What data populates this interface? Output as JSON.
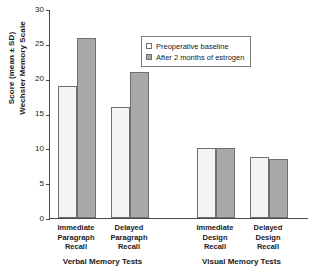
{
  "chart_data": {
    "type": "bar",
    "title": "",
    "xlabel": "",
    "ylabel": "Score (mean ± SD) Wechsler Memory Scale",
    "ylabel_lines": [
      "Score (mean ± SD)",
      "Wechsler Memory Scale"
    ],
    "ylim": [
      0,
      30
    ],
    "yticks": [
      0,
      5,
      10,
      15,
      20,
      25,
      30
    ],
    "ytick_labels": [
      "0",
      "5",
      "10",
      "15",
      "20",
      "25",
      "30"
    ],
    "grid": false,
    "legend_position": "upper right inside",
    "categories": [
      "Immediate Paragraph Recall",
      "Delayed Paragraph Recall",
      "Immediate Design Recall",
      "Delayed Design Recall"
    ],
    "category_lines": [
      [
        "Immediate",
        "Paragraph",
        "Recall"
      ],
      [
        "Delayed",
        "Paragraph",
        "Recall"
      ],
      [
        "Immediate",
        "Design",
        "Recall"
      ],
      [
        "Delayed",
        "Design",
        "Recall"
      ]
    ],
    "series": [
      {
        "name": "Preoperative baseline",
        "color": "#f4f4f4",
        "values": [
          19.0,
          15.9,
          10.1,
          8.7
        ]
      },
      {
        "name": "After 2 months of estrogen",
        "color": "#a9a9a9",
        "values": [
          25.8,
          21.0,
          10.0,
          8.4
        ]
      }
    ],
    "groups": [
      {
        "label": "Verbal Memory Tests",
        "categories": [
          0,
          1
        ]
      },
      {
        "label": "Visual Memory Tests",
        "categories": [
          2,
          3
        ]
      }
    ]
  },
  "legend": {
    "items": [
      {
        "label": "Preoperative baseline",
        "swatch": "light"
      },
      {
        "label": "After 2 months of estrogen",
        "swatch": "dark"
      }
    ]
  },
  "colors": {
    "baseline_fill": "#f4f4f4",
    "estrogen_fill": "#a9a9a9",
    "bar_outline": "#6f6f6f",
    "axis": "#4a4a4a",
    "text": "#1a1a1a",
    "background": "#ffffff"
  }
}
